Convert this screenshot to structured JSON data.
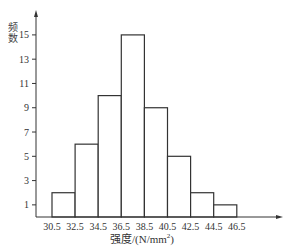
{
  "chart_data": {
    "type": "bar",
    "subtype": "histogram",
    "title": "",
    "xlabel": "强度/(N/mm²)",
    "ylabel": "频数",
    "bin_edges": [
      30.5,
      32.5,
      34.5,
      36.5,
      38.5,
      40.5,
      42.5,
      44.5,
      46.5
    ],
    "categories": [
      "30.5-32.5",
      "32.5-34.5",
      "34.5-36.5",
      "36.5-38.5",
      "38.5-40.5",
      "40.5-42.5",
      "42.5-44.5",
      "44.5-46.5"
    ],
    "values": [
      2,
      6,
      10,
      15,
      9,
      5,
      2,
      1
    ],
    "x_tick_labels": [
      "30.5",
      "32.5",
      "34.5",
      "36.5",
      "38.5",
      "40.5",
      "42.5",
      "44.5",
      "46.5"
    ],
    "y_tick_labels": [
      "1",
      "3",
      "5",
      "7",
      "9",
      "11",
      "13",
      "15"
    ],
    "y_ticks": [
      1,
      3,
      5,
      7,
      9,
      11,
      13,
      15
    ],
    "ylim": [
      0,
      17
    ],
    "grid": false,
    "legend": null
  },
  "labels": {
    "y_axis": "频数",
    "x_axis_main": "强度/(N/mm",
    "x_axis_sup": "2",
    "x_axis_close": ")"
  },
  "colors": {
    "bar_edge": "#333333",
    "bar_fill": "#ffffff",
    "axis": "#333333"
  }
}
